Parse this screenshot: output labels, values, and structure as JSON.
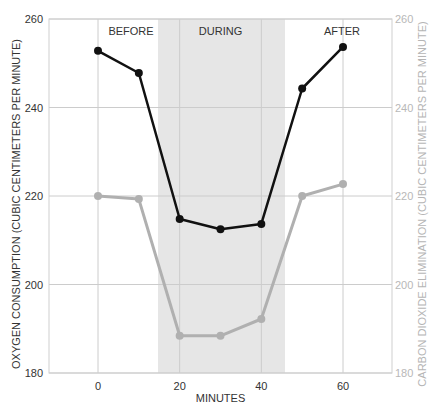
{
  "chart_data": {
    "type": "line",
    "title": "",
    "xlabel": "MINUTES",
    "ylabel": "OXYGEN CONSUMPTION (CUBIC CENTIMETERS PER MINUTE)",
    "ylabel_right": "CARBON DIOXIDE ELIMINATION (CUBIC CENTIMETERS PER MINUTE)",
    "x": [
      0,
      10,
      20,
      30,
      40,
      50,
      60
    ],
    "xlim": [
      -12,
      72
    ],
    "ylim": [
      180,
      260
    ],
    "ylim_right": [
      180,
      260
    ],
    "x_ticks": [
      0,
      20,
      40,
      60
    ],
    "y_ticks": [
      180,
      200,
      220,
      240,
      260
    ],
    "y_ticks_right": [
      180,
      200,
      220,
      240,
      260
    ],
    "grid": true,
    "series": [
      {
        "name": "Oxygen consumption",
        "axis": "left",
        "color": "#111111",
        "values": [
          252.8,
          247.8,
          214.8,
          212.5,
          213.7,
          244.3,
          253.7
        ]
      },
      {
        "name": "Carbon dioxide elimination",
        "axis": "right",
        "color": "#b0b0b0",
        "values": [
          220.0,
          219.3,
          188.4,
          188.4,
          192.2,
          220.0,
          222.7
        ]
      }
    ],
    "shaded_region": {
      "label": "DURING",
      "x_start": 14.7,
      "x_end": 45.8,
      "color": "#e6e6e6"
    },
    "annotations": [
      {
        "text": "BEFORE",
        "x": 0
      },
      {
        "text": "DURING",
        "x": 30
      },
      {
        "text": "AFTER",
        "x": 60
      }
    ],
    "legend": "none"
  }
}
